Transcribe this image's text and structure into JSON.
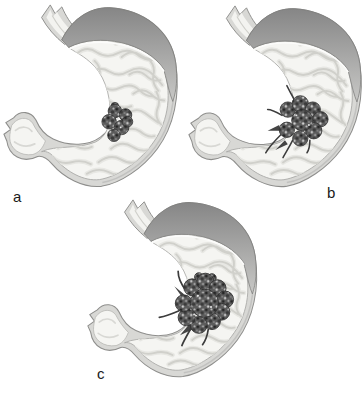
{
  "figure": {
    "kind": "stomach-tumor-progression-illustration",
    "panels": [
      {
        "id": "a",
        "label": "a",
        "tumor_icon": "tumor-mass-small"
      },
      {
        "id": "b",
        "label": "b",
        "tumor_icon": "tumor-mass-medium"
      },
      {
        "id": "c",
        "label": "c",
        "tumor_icon": "tumor-mass-large"
      }
    ]
  },
  "colors": {
    "background": "#ffffff",
    "wall": "#d8d8d5",
    "outline": "#8e8e8c",
    "interior": "#f5f5f2",
    "interior_rim": "#a8a8a6",
    "midwall_line": "#c2c2c0",
    "dome_dark": "#868686",
    "dome_light": "#c8c8c6",
    "rim_highlight": "#fcfcfb",
    "rugae_light": "#e7e7e3",
    "rugae_mid": "#d0d0cb",
    "fold_line": "#d8d8d4",
    "tumor_base": "#5c5c5c",
    "tumor_outline": "#2e2e2e",
    "tumor_streak": "#3c3c3c",
    "label_ink": "#1a1a1a"
  }
}
